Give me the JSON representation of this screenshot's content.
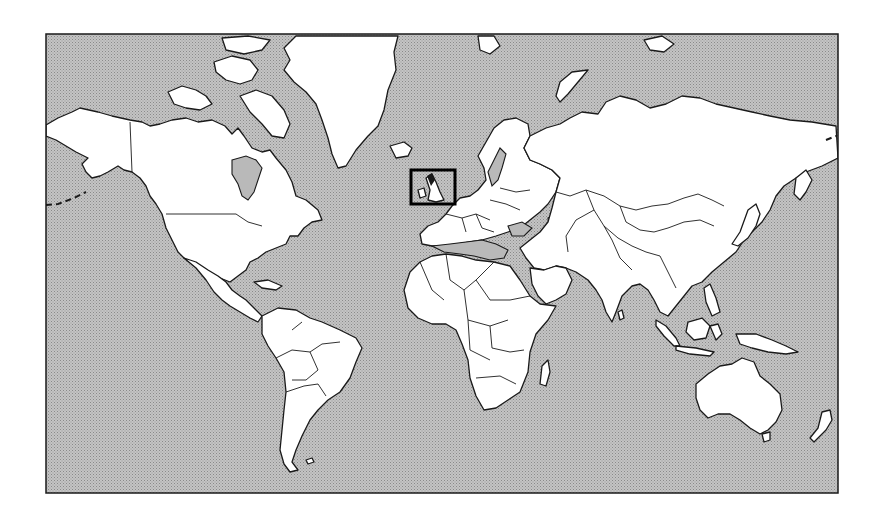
{
  "map": {
    "type": "world-map",
    "projection": "mercator",
    "style": "black-and-white outline, stippled gray ocean",
    "colors": {
      "ocean": "#b3b3b3",
      "land": "#ffffff",
      "outline": "#1a1a1a",
      "highlight": "#000000"
    },
    "frame": {
      "x": 46,
      "y": 34,
      "width": 792,
      "height": 459
    },
    "highlight_box": {
      "label": "British Isles",
      "x": 411,
      "y": 170,
      "width": 44,
      "height": 34
    },
    "regions": [
      "North America",
      "Greenland",
      "South America",
      "Europe",
      "Africa",
      "Asia",
      "Australia",
      "New Zealand"
    ],
    "date_line_dashes": true
  }
}
